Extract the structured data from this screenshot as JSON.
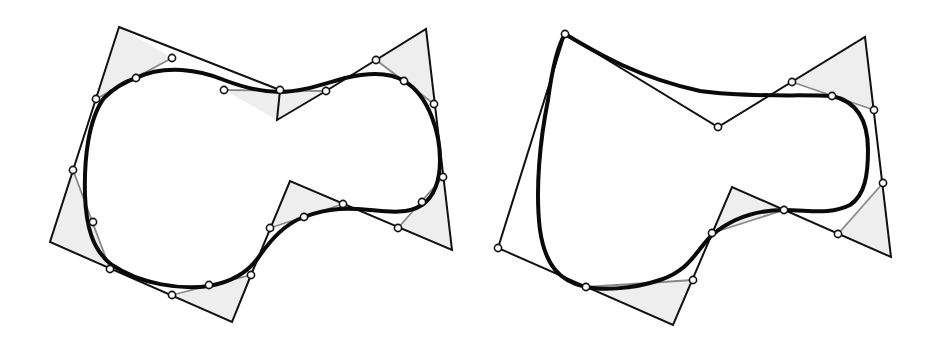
{
  "figures": [
    {
      "name": "left-closed-spline",
      "control_polygon": [
        [
          119,
          27
        ],
        [
          280,
          90
        ],
        [
          277,
          120
        ],
        [
          326,
          91
        ],
        [
          426,
          29
        ],
        [
          452,
          250
        ],
        [
          290,
          181
        ],
        [
          251,
          275
        ],
        [
          232,
          322
        ],
        [
          50,
          242
        ]
      ],
      "corner_triangles": [
        [
          [
            96,
            99
          ],
          [
            119,
            27
          ],
          [
            172,
            58
          ]
        ],
        [
          [
            224,
            90
          ],
          [
            277,
            120
          ],
          [
            326,
            91
          ]
        ],
        [
          [
            376,
            60
          ],
          [
            426,
            29
          ],
          [
            434,
            104
          ]
        ],
        [
          [
            443,
            177
          ],
          [
            452,
            250
          ],
          [
            398,
            228
          ]
        ],
        [
          [
            343,
            204
          ],
          [
            290,
            181
          ],
          [
            270,
            228
          ]
        ],
        [
          [
            251,
            275
          ],
          [
            232,
            322
          ],
          [
            172,
            295
          ]
        ],
        [
          [
            110,
            269
          ],
          [
            50,
            242
          ],
          [
            73,
            170
          ]
        ]
      ],
      "points": [
        [
          172,
          58
        ],
        [
          136,
          78
        ],
        [
          96,
          99
        ],
        [
          224,
          90
        ],
        [
          280,
          90
        ],
        [
          326,
          91
        ],
        [
          376,
          60
        ],
        [
          404,
          81
        ],
        [
          434,
          104
        ],
        [
          443,
          177
        ],
        [
          422,
          202
        ],
        [
          398,
          228
        ],
        [
          343,
          204
        ],
        [
          304,
          217
        ],
        [
          270,
          228
        ],
        [
          251,
          275
        ],
        [
          209,
          285
        ],
        [
          172,
          295
        ],
        [
          110,
          269
        ],
        [
          93,
          222
        ],
        [
          73,
          170
        ]
      ],
      "curve": "M136,78 C165,64 200,70 224,80 C245,88 262,92 280,92 C300,92 320,85 345,78 C370,72 390,72 404,81 C430,96 440,135 440,160 C440,185 432,198 422,205 C408,214 390,212 370,210 C350,208 330,207 304,217 C285,224 272,238 258,258 C248,272 232,282 209,286 C180,290 140,284 112,265 C92,250 86,225 85,195 C84,160 88,120 104,98 C114,88 124,82 136,78 Z"
    },
    {
      "name": "right-spline-with-corner",
      "control_polygon": [
        [
          565,
          34
        ],
        [
          718,
          127
        ],
        [
          865,
          37
        ],
        [
          891,
          257
        ],
        [
          732,
          187
        ],
        [
          673,
          325
        ],
        [
          498,
          248
        ]
      ],
      "corner_triangles": [
        [
          [
            792,
            82
          ],
          [
            865,
            37
          ],
          [
            874,
            110
          ]
        ],
        [
          [
            883,
            183
          ],
          [
            891,
            257
          ],
          [
            838,
            234
          ]
        ],
        [
          [
            784,
            210
          ],
          [
            732,
            187
          ],
          [
            712,
            233
          ]
        ],
        [
          [
            693,
            280
          ],
          [
            673,
            325
          ],
          [
            586,
            287
          ]
        ]
      ],
      "points": [
        [
          565,
          34
        ],
        [
          718,
          127
        ],
        [
          792,
          82
        ],
        [
          832,
          96
        ],
        [
          874,
          110
        ],
        [
          883,
          183
        ],
        [
          838,
          234
        ],
        [
          784,
          210
        ],
        [
          712,
          233
        ],
        [
          693,
          280
        ],
        [
          586,
          287
        ],
        [
          498,
          248
        ]
      ],
      "curve": "M565,34 C600,55 640,78 700,91 C750,98 800,94 832,96 C860,102 868,125 868,150 C868,175 865,195 850,205 C830,215 810,210 784,210 C755,210 730,220 712,235 C695,252 690,270 660,280 C630,290 600,290 586,287 C560,282 545,265 540,230 C535,190 540,140 548,100 C552,70 558,45 565,34 Z"
    }
  ],
  "colors": {
    "background": "#ffffff",
    "stroke": "#111111",
    "triangle_fill": "#eeeeee",
    "chord": "#888888",
    "curve": "#0a0a0a"
  }
}
